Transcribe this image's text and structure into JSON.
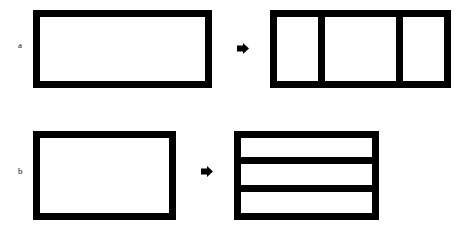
{
  "diagram": {
    "rows": [
      {
        "label": "a",
        "before": {
          "shape": "rectangle",
          "divisions": 1
        },
        "transition": "arrow-right",
        "after": {
          "shape": "rectangle",
          "divisions": 3,
          "orientation": "vertical"
        }
      },
      {
        "label": "b",
        "before": {
          "shape": "rectangle",
          "divisions": 1
        },
        "transition": "arrow-right",
        "after": {
          "shape": "rectangle",
          "divisions": 3,
          "orientation": "horizontal"
        }
      }
    ],
    "colors": {
      "stroke": "#000000",
      "fill": "#ffffff"
    }
  }
}
